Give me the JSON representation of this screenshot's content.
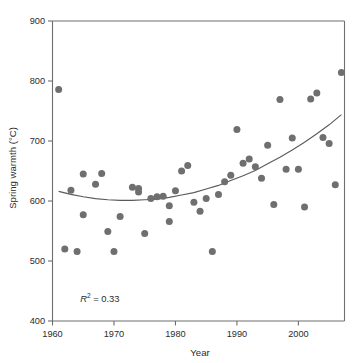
{
  "chart_data": {
    "type": "scatter",
    "title": "",
    "xlabel": "Year",
    "ylabel": "Spring warmth (°C)",
    "xlim": [
      1960,
      2007.5
    ],
    "ylim": [
      400,
      900
    ],
    "xticks": [
      1960,
      1970,
      1980,
      1990,
      2000
    ],
    "yticks": [
      400,
      500,
      600,
      700,
      800,
      900
    ],
    "xtick_labels": [
      "1960",
      "1970",
      "1980",
      "1990",
      "2000"
    ],
    "ytick_labels": [
      "400",
      "500",
      "600",
      "700",
      "800",
      "900"
    ],
    "grid": false,
    "legend": false,
    "marker_color": "#6f6f6f",
    "curve_color": "#5a5a5a",
    "axis_color": "#6e6e6e",
    "annotations": [
      {
        "name": "r-squared",
        "prefix": "R",
        "superscript": "2",
        "suffix": " = 0.33",
        "text": "R2 = 0.33",
        "x": 1964.5,
        "y": 432
      }
    ],
    "series": [
      {
        "name": "Spring warmth",
        "marker": "circle",
        "points": [
          {
            "x": 1961,
            "y": 786
          },
          {
            "x": 1962,
            "y": 520
          },
          {
            "x": 1963,
            "y": 618
          },
          {
            "x": 1964,
            "y": 516
          },
          {
            "x": 1965,
            "y": 645
          },
          {
            "x": 1965,
            "y": 577
          },
          {
            "x": 1967,
            "y": 628
          },
          {
            "x": 1968,
            "y": 646
          },
          {
            "x": 1969,
            "y": 549
          },
          {
            "x": 1970,
            "y": 516
          },
          {
            "x": 1971,
            "y": 574
          },
          {
            "x": 1973,
            "y": 623
          },
          {
            "x": 1974,
            "y": 621
          },
          {
            "x": 1974,
            "y": 615
          },
          {
            "x": 1975,
            "y": 546
          },
          {
            "x": 1976,
            "y": 604
          },
          {
            "x": 1977,
            "y": 607
          },
          {
            "x": 1978,
            "y": 608
          },
          {
            "x": 1979,
            "y": 592
          },
          {
            "x": 1979,
            "y": 566
          },
          {
            "x": 1980,
            "y": 617
          },
          {
            "x": 1981,
            "y": 650
          },
          {
            "x": 1982,
            "y": 659
          },
          {
            "x": 1983,
            "y": 598
          },
          {
            "x": 1984,
            "y": 583
          },
          {
            "x": 1985,
            "y": 604
          },
          {
            "x": 1986,
            "y": 516
          },
          {
            "x": 1987,
            "y": 611
          },
          {
            "x": 1988,
            "y": 632
          },
          {
            "x": 1989,
            "y": 643
          },
          {
            "x": 1990,
            "y": 719
          },
          {
            "x": 1991,
            "y": 663
          },
          {
            "x": 1992,
            "y": 670
          },
          {
            "x": 1993,
            "y": 657
          },
          {
            "x": 1994,
            "y": 638
          },
          {
            "x": 1995,
            "y": 693
          },
          {
            "x": 1996,
            "y": 594
          },
          {
            "x": 1997,
            "y": 769
          },
          {
            "x": 1998,
            "y": 653
          },
          {
            "x": 1999,
            "y": 705
          },
          {
            "x": 2000,
            "y": 653
          },
          {
            "x": 2001,
            "y": 590
          },
          {
            "x": 2002,
            "y": 770
          },
          {
            "x": 2003,
            "y": 780
          },
          {
            "x": 2004,
            "y": 706
          },
          {
            "x": 2005,
            "y": 696
          },
          {
            "x": 2006,
            "y": 627
          },
          {
            "x": 2007,
            "y": 814
          }
        ]
      }
    ],
    "fit_curve": {
      "name": "quadratic-trend",
      "x": [
        1961,
        1963,
        1965,
        1967,
        1969,
        1971,
        1973,
        1975,
        1977,
        1979,
        1981,
        1983,
        1985,
        1987,
        1989,
        1991,
        1993,
        1995,
        1997,
        1999,
        2001,
        2003,
        2005,
        2007
      ],
      "y": [
        616,
        611,
        607,
        604,
        602,
        601,
        601,
        602,
        603,
        606,
        610,
        614,
        620,
        626,
        634,
        642,
        651,
        662,
        673,
        685,
        698,
        712,
        727,
        744
      ]
    }
  }
}
